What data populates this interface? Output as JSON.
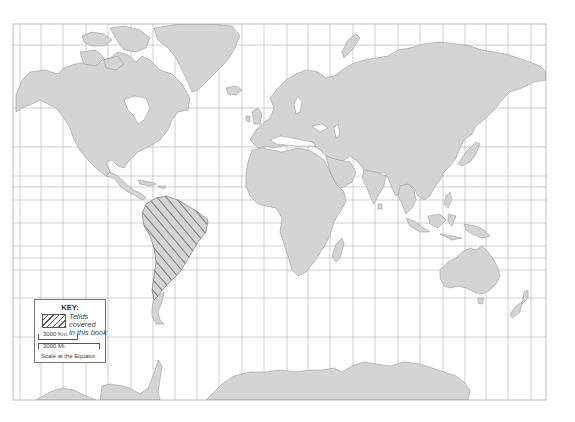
{
  "map": {
    "title": "World map (Mercator projection)",
    "colors": {
      "land": "#d4d4d4",
      "land_outline": "#8a8a8a",
      "grid": "#b0b0b0",
      "background": "#ffffff",
      "hatch": "#555555"
    },
    "frame": {
      "x": 13,
      "y": 24,
      "width": 533,
      "height": 376
    },
    "grid_vertical_x": [
      20,
      41,
      63,
      86,
      108,
      131,
      153,
      175,
      197,
      219,
      242,
      264,
      287,
      308,
      330,
      353,
      375,
      398,
      420,
      443,
      465,
      486,
      508,
      531
    ],
    "grid_horizontal_y": [
      45,
      108,
      147,
      176,
      187,
      200,
      223,
      246,
      258,
      270,
      298,
      337
    ],
    "highlighted_region": "South America"
  },
  "key": {
    "title": "KEY:",
    "legend_label_line1": "Teiids covered",
    "legend_label_line2": "in this book",
    "scale_km": "3000 Km.",
    "scale_mi": "3000 Mi.",
    "scale_caption": "Scale at the Equator."
  }
}
